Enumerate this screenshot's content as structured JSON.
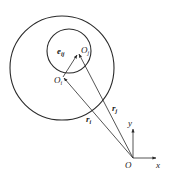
{
  "diagram": {
    "colors": {
      "stroke": "#2a2a2a",
      "text": "#222222",
      "background": "#ffffff"
    },
    "outer_circle": {
      "cx": 62,
      "cy": 68,
      "r": 52
    },
    "inner_circle": {
      "cx": 69,
      "cy": 51,
      "r": 22
    },
    "points": {
      "O": {
        "x": 133,
        "y": 158
      },
      "Oi": {
        "x": 63,
        "y": 77
      },
      "Oj": {
        "x": 78,
        "y": 53
      }
    },
    "labels": {
      "origin": "O",
      "Oi_main": "O",
      "Oi_sub": "i",
      "Oj_main": "O",
      "Oj_sub": "j",
      "ri_main": "r",
      "ri_sub": "i",
      "rj_main": "r",
      "rj_sub": "j",
      "eij_main": "e",
      "eij_sub": "ij",
      "x_axis": "x",
      "y_axis": "y"
    },
    "vectors": [
      {
        "name": "r_i",
        "from": "O",
        "to": "Oi"
      },
      {
        "name": "r_j",
        "from": "O",
        "to": "Oj"
      },
      {
        "name": "e_ij",
        "from": "Oi",
        "to": "Oj"
      }
    ],
    "axes": {
      "x_end": {
        "x": 156,
        "y": 158
      },
      "y_end": {
        "x": 133,
        "y": 128
      }
    }
  }
}
